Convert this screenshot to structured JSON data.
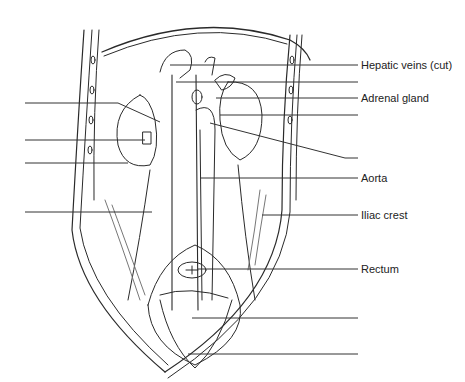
{
  "figure": {
    "labels_right": [
      {
        "text": "Hepatic veins (cut)",
        "y": 65
      },
      {
        "text": "",
        "y": 82
      },
      {
        "text": "Adrenal gland",
        "y": 98
      },
      {
        "text": "",
        "y": 115
      },
      {
        "text": "",
        "y": 158
      },
      {
        "text": "Aorta",
        "y": 178
      },
      {
        "text": "Iliac crest",
        "y": 215
      },
      {
        "text": "Rectum",
        "y": 269
      },
      {
        "text": "",
        "y": 318
      },
      {
        "text": "",
        "y": 354
      }
    ],
    "labels_left": [
      {
        "text": "",
        "y": 103
      },
      {
        "text": "",
        "y": 140
      },
      {
        "text": "",
        "y": 163
      },
      {
        "text": "",
        "y": 212
      }
    ],
    "line_color": "#333333"
  }
}
